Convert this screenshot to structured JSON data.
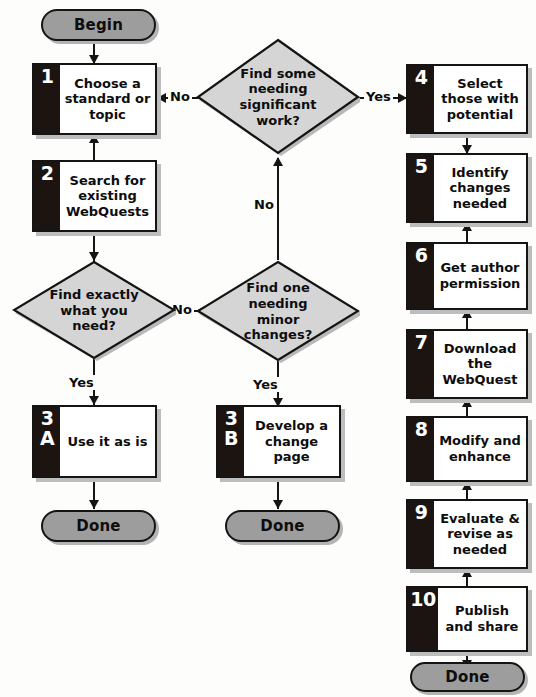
{
  "diagram": {
    "colors": {
      "terminator_fill": "#9d9d9d",
      "diamond_fill": "#d5d5d5",
      "tab_fill": "#1b1411",
      "box_fill": "#ffffff",
      "stroke": "#141414",
      "shadow": "#bdbdbd"
    }
  },
  "terminators": {
    "begin": "Begin",
    "done_a": "Done",
    "done_b": "Done",
    "done_right": "Done"
  },
  "steps": [
    {
      "num": "1",
      "num2": "",
      "text": "Choose a standard or topic"
    },
    {
      "num": "2",
      "num2": "",
      "text": "Search for existing WebQuests"
    },
    {
      "num": "3",
      "num2": "A",
      "text": "Use it as is"
    },
    {
      "num": "3",
      "num2": "B",
      "text": "Develop a change page"
    },
    {
      "num": "4",
      "num2": "",
      "text": "Select those with potential"
    },
    {
      "num": "5",
      "num2": "",
      "text": "Identify changes needed"
    },
    {
      "num": "6",
      "num2": "",
      "text": "Get author permission"
    },
    {
      "num": "7",
      "num2": "",
      "text": "Download the WebQuest"
    },
    {
      "num": "8",
      "num2": "",
      "text": "Modify and enhance"
    },
    {
      "num": "9",
      "num2": "",
      "text": "Evaluate & revise as needed"
    },
    {
      "num": "10",
      "num2": "",
      "text": "Publish and share"
    }
  ],
  "decisions": [
    {
      "id": "find-exactly",
      "text": "Find exactly what you need?"
    },
    {
      "id": "find-some",
      "text": "Find some needing significant work?"
    },
    {
      "id": "find-one-minor",
      "text": "Find one needing minor changes?"
    }
  ],
  "edge_labels": {
    "no_to_step1": "No",
    "yes_to_step4": "Yes",
    "no_up_to_find_some": "No",
    "yes_to_3a": "Yes",
    "no_to_find_one": "No",
    "yes_to_3b": "Yes"
  }
}
